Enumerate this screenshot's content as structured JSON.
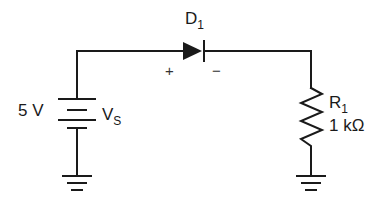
{
  "diagram": {
    "type": "circuit-schematic",
    "source": {
      "label_value": "5 V",
      "label_name": "V",
      "label_name_sub": "S"
    },
    "diode": {
      "label": "D",
      "label_sub": "1",
      "anode_sign": "+",
      "cathode_sign": "−"
    },
    "resistor": {
      "label": "R",
      "label_sub": "1",
      "value": "1 kΩ"
    },
    "grounds": [
      "source-ground",
      "resistor-ground"
    ],
    "colors": {
      "ink": "#1a1a1a",
      "background": "#ffffff"
    }
  }
}
